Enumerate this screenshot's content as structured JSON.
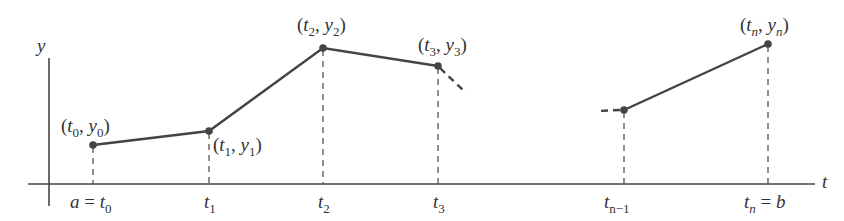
{
  "diagram": {
    "axes": {
      "x_label": "t",
      "y_label": "y"
    },
    "colors": {
      "line": "#444444",
      "text": "#333333",
      "background": "#ffffff"
    },
    "points": [
      {
        "id": "p0",
        "label_t": "t",
        "sub_t": "0",
        "label_y": "y",
        "sub_y": "0",
        "x": 93,
        "y": 145
      },
      {
        "id": "p1",
        "label_t": "t",
        "sub_t": "1",
        "label_y": "y",
        "sub_y": "1",
        "x": 209,
        "y": 131
      },
      {
        "id": "p2",
        "label_t": "t",
        "sub_t": "2",
        "label_y": "y",
        "sub_y": "2",
        "x": 323,
        "y": 48
      },
      {
        "id": "p3",
        "label_t": "t",
        "sub_t": "3",
        "label_y": "y",
        "sub_y": "3",
        "x": 438,
        "y": 66
      },
      {
        "id": "pn-1",
        "x": 624,
        "y": 110
      },
      {
        "id": "pn",
        "label_t": "t",
        "sub_t": "n",
        "label_y": "y",
        "sub_y": "n",
        "x": 768,
        "y": 44
      }
    ],
    "tick_labels": [
      {
        "id": "t0",
        "prefix": "a = ",
        "var": "t",
        "sub": "0"
      },
      {
        "id": "t1",
        "var": "t",
        "sub": "1"
      },
      {
        "id": "t2",
        "var": "t",
        "sub": "2"
      },
      {
        "id": "t3",
        "var": "t",
        "sub": "3"
      },
      {
        "id": "tn-1",
        "var": "t",
        "sub": "n−1"
      },
      {
        "id": "tn",
        "var": "t",
        "sub": "n",
        "suffix": " = b"
      }
    ],
    "punct": {
      "open": "(",
      "comma": ", ",
      "close": ")"
    }
  }
}
